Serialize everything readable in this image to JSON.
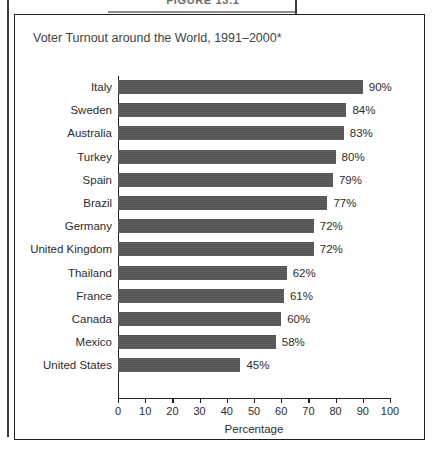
{
  "figure": {
    "caption_label": "FIGURE 13.1",
    "title": "Voter Turnout around the World, 1991–2000*"
  },
  "chart_data": {
    "type": "bar",
    "orientation": "horizontal",
    "title": "Voter Turnout around the World, 1991–2000*",
    "xlabel": "Percentage",
    "ylabel": "",
    "xlim": [
      0,
      100
    ],
    "xticks": [
      0,
      10,
      20,
      30,
      40,
      50,
      60,
      70,
      80,
      90,
      100
    ],
    "grid": false,
    "legend": "none",
    "bar_color": "#585859",
    "categories": [
      "Italy",
      "Sweden",
      "Australia",
      "Turkey",
      "Spain",
      "Brazil",
      "Germany",
      "United Kingdom",
      "Thailand",
      "France",
      "Canada",
      "Mexico",
      "United States"
    ],
    "values": [
      90,
      84,
      83,
      80,
      79,
      77,
      72,
      72,
      62,
      61,
      60,
      58,
      45
    ],
    "value_labels": [
      "90%",
      "84%",
      "83%",
      "80%",
      "79%",
      "77%",
      "72%",
      "72%",
      "62%",
      "61%",
      "60%",
      "58%",
      "45%"
    ]
  }
}
